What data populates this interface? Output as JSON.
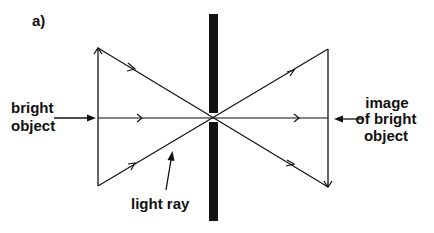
{
  "panel_label": "a)",
  "labels": {
    "object": [
      "bright",
      "object"
    ],
    "image": [
      "image",
      "of bright",
      "object"
    ],
    "ray": "light ray"
  },
  "elements": {
    "barrier": "opaque barrier with pinhole",
    "object_arrow": "upright arrow (object)",
    "image_arrow": "inverted arrow (image)",
    "rays": [
      "top ray",
      "central ray",
      "bottom ray"
    ]
  },
  "colors": {
    "ink": "#111111",
    "background": "#ffffff"
  }
}
